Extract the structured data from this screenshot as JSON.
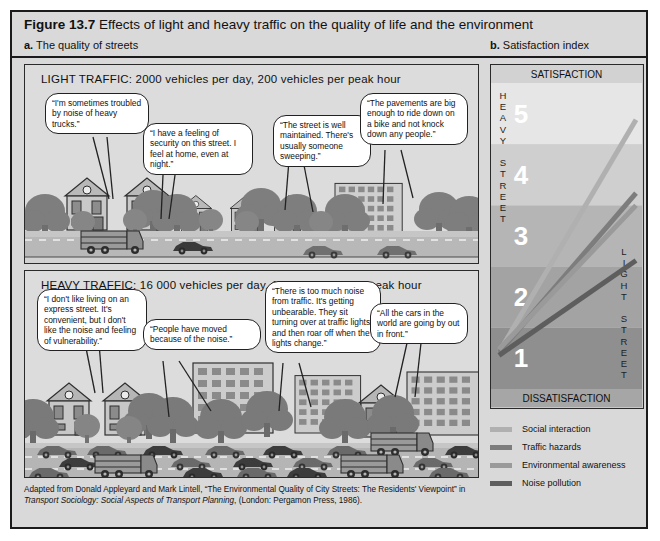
{
  "figure": {
    "number": "Figure 13.7",
    "title": "Effects of light and heavy traffic on the quality of life and the environment",
    "sub_a_marker": "a.",
    "sub_a_label": "The quality of streets",
    "sub_b_marker": "b.",
    "sub_b_label": "Satisfaction index"
  },
  "panels": {
    "light": {
      "caption": "LIGHT TRAFFIC: 2000 vehicles per day, 200 vehicles per peak hour",
      "quotes": [
        "“I'm sometimes troubled by noise of heavy trucks.”",
        "“I have a feeling of security on this street. I feel at home, even at night.”",
        "“The street is well maintained. There's usually someone sweeping.”",
        "“The pavements are big enough to ride down on a bike and not knock down any people.”"
      ]
    },
    "heavy": {
      "caption": "HEAVY TRAFFIC: 16 000 vehicles per day, 1900 vehicles per peak hour",
      "quotes": [
        "“I don't like living on an express street. It's convenient, but I don't like the noise and feeling of vulnerability.”",
        "“People have moved because of the noise.”",
        "“There is too much noise from traffic.  It's getting unbearable. They sit turning over at traffic lights and then roar off when the lights change.”",
        "“All the cars in the world are going by out in front.”"
      ]
    }
  },
  "source": {
    "part1": "Adapted from Donald Appleyard and Mark Lintell, “The Environmental Quality of City Streets: The Residents' Viewpoint” in ",
    "italic": "Transport Sociology: Social Aspects of Transport Planning",
    "part2": ", (London: Pergamon Press, 1986)."
  },
  "chart_data": {
    "type": "line",
    "title": "Satisfaction index",
    "top_label": "SATISFACTION",
    "bottom_label": "DISSATISFACTION",
    "left_axis_label": "HEAVY STREET",
    "right_axis_label": "LIGHT STREET",
    "scale_labels": [
      "1",
      "2",
      "3",
      "4",
      "5"
    ],
    "ylim": [
      1,
      5
    ],
    "xlabel": "",
    "ylabel": "Satisfaction index",
    "grid": false,
    "legend_position": "below",
    "band_colors": [
      "#8f8f8f",
      "#a3a3a3",
      "#b5b5b5",
      "#cfcfcf",
      "#e6e6e6"
    ],
    "x": [
      "Heavy street",
      "Light street"
    ],
    "series": [
      {
        "name": "Social interaction",
        "color": "#b0b0b0",
        "values": [
          1.1,
          4.9
        ]
      },
      {
        "name": "Traffic hazards",
        "color": "#7d7d7d",
        "values": [
          1.1,
          3.7
        ]
      },
      {
        "name": "Environmental awareness",
        "color": "#9a9a9a",
        "values": [
          1.15,
          3.5
        ]
      },
      {
        "name": "Noise pollution",
        "color": "#5e5e5e",
        "values": [
          1.05,
          2.6
        ]
      }
    ]
  },
  "legend": {
    "items": [
      {
        "label": "Social interaction",
        "color": "#b0b0b0"
      },
      {
        "label": "Traffic hazards",
        "color": "#7d7d7d"
      },
      {
        "label": "Environmental awareness",
        "color": "#9a9a9a"
      },
      {
        "label": "Noise pollution",
        "color": "#5e5e5e"
      }
    ]
  }
}
